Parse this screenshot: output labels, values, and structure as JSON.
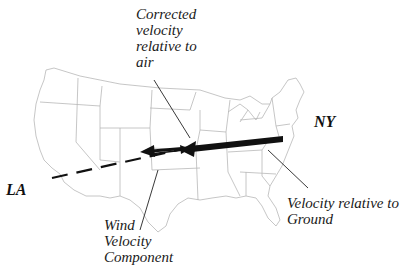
{
  "diagram": {
    "title": "",
    "cities": {
      "origin": "NY",
      "destination": "LA"
    },
    "labels": {
      "corrected_velocity": "Corrected\nvelocity\nrelative to\nair",
      "ground_velocity": "Velocity relative to\nGround",
      "wind_component": "Wind\nVelocity\nComponent"
    },
    "vectors": [
      {
        "name": "velocity-relative-to-ground",
        "from": "NY",
        "direction": "west",
        "style": "thick solid"
      },
      {
        "name": "corrected-velocity-relative-to-air",
        "direction": "west",
        "style": "medium solid"
      },
      {
        "name": "wind-velocity-component",
        "direction": "east",
        "style": "thin solid"
      },
      {
        "name": "path-to-LA",
        "to": "LA",
        "style": "dashed"
      }
    ],
    "colors": {
      "map_outline": "#b8b8b8",
      "vector": "#111111",
      "text": "#1a1a1a"
    }
  }
}
